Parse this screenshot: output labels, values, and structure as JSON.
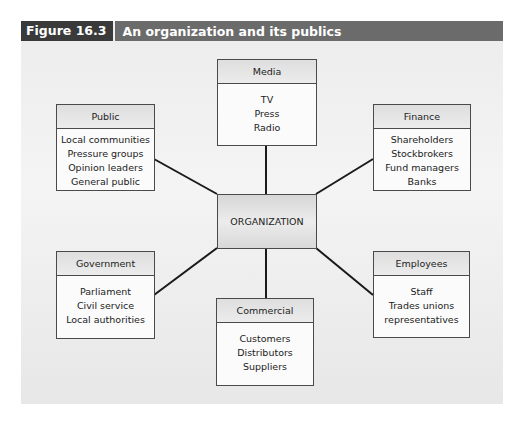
{
  "figure": {
    "label": "Figure 16.3",
    "title": "An organization and its publics",
    "colors": {
      "title_bar": "#6b6b6b",
      "label_bg": "#3a3a3a",
      "panel": "#ededed",
      "line": "#1a1a1a"
    }
  },
  "center": {
    "label": "ORGANIZATION"
  },
  "nodes": {
    "media": {
      "title": "Media",
      "items": [
        "TV",
        "Press",
        "Radio"
      ]
    },
    "public": {
      "title": "Public",
      "items": [
        "Local communities",
        "Pressure groups",
        "Opinion leaders",
        "General public"
      ]
    },
    "finance": {
      "title": "Finance",
      "items": [
        "Shareholders",
        "Stockbrokers",
        "Fund managers",
        "Banks"
      ]
    },
    "government": {
      "title": "Government",
      "items": [
        "Parliament",
        "Civil service",
        "Local authorities"
      ]
    },
    "employees": {
      "title": "Employees",
      "items": [
        "Staff",
        "Trades unions",
        "representatives"
      ]
    },
    "commercial": {
      "title": "Commercial",
      "items": [
        "Customers",
        "Distributors",
        "Suppliers"
      ]
    }
  }
}
